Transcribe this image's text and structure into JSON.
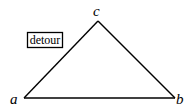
{
  "diagram": {
    "type": "triangle",
    "vertices": {
      "a": {
        "label": "a",
        "x": 24,
        "y": 98
      },
      "b": {
        "label": "b",
        "x": 175,
        "y": 98
      },
      "c": {
        "label": "c",
        "x": 98,
        "y": 21
      }
    },
    "edges": [
      [
        "a",
        "b"
      ],
      [
        "b",
        "c"
      ],
      [
        "c",
        "a"
      ]
    ],
    "annotation": {
      "text": "detour"
    },
    "stroke_color": "#000000",
    "background_color": "#ffffff"
  }
}
